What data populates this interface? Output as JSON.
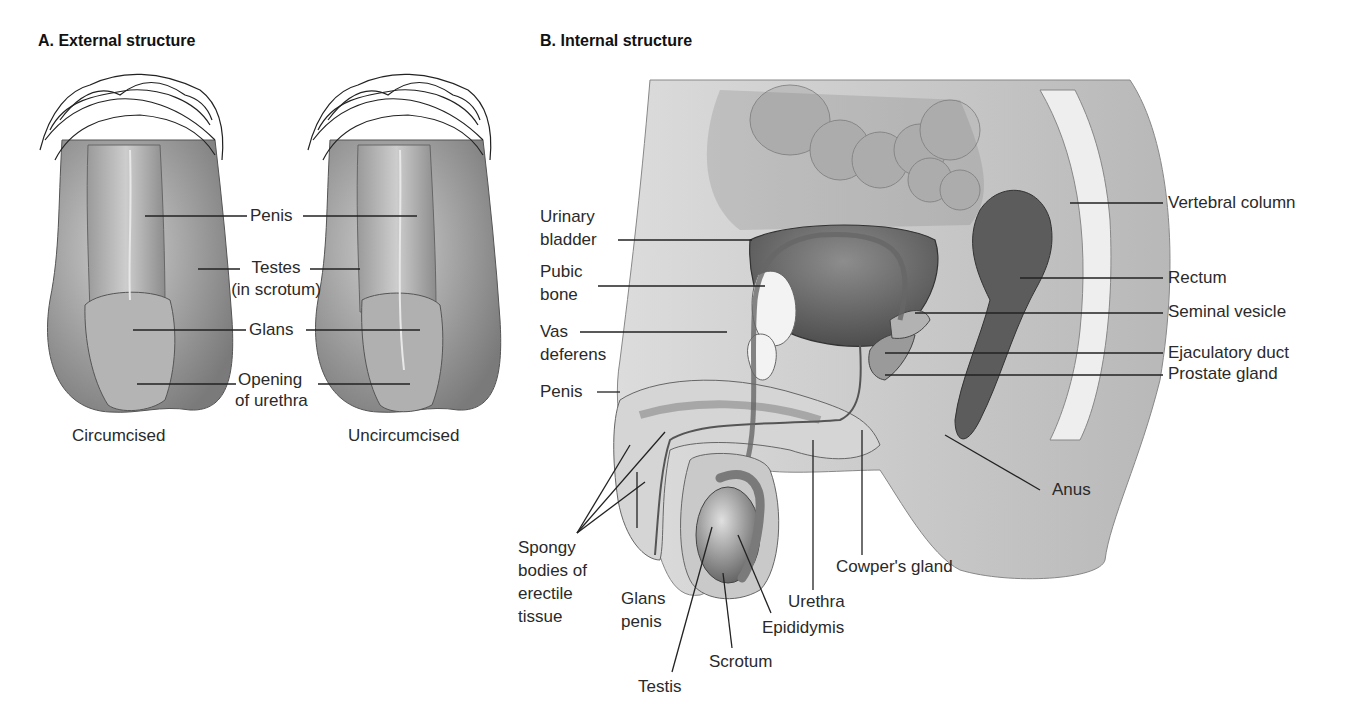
{
  "panels": {
    "external": {
      "title": "A. External structure",
      "captions": [
        "Circumcised",
        "Uncircumcised"
      ],
      "labels": {
        "penis": "Penis",
        "testes_1": "Testes",
        "testes_2": "(in scrotum)",
        "glans": "Glans",
        "opening_1": "Opening",
        "opening_2": "of urethra"
      }
    },
    "internal": {
      "title": "B. Internal structure",
      "labels": {
        "urinary_bladder_1": "Urinary",
        "urinary_bladder_2": "bladder",
        "pubic_bone_1": "Pubic",
        "pubic_bone_2": "bone",
        "vas_deferens_1": "Vas",
        "vas_deferens_2": "deferens",
        "penis": "Penis",
        "spongy_1": "Spongy",
        "spongy_2": "bodies of",
        "spongy_3": "erectile",
        "spongy_4": "tissue",
        "glans_penis_1": "Glans",
        "glans_penis_2": "penis",
        "testis": "Testis",
        "scrotum": "Scrotum",
        "epididymis": "Epididymis",
        "urethra": "Urethra",
        "cowpers_gland": "Cowper's gland",
        "anus": "Anus",
        "vertebral_column": "Vertebral column",
        "rectum": "Rectum",
        "seminal_vesicle": "Seminal vesicle",
        "ejaculatory_duct": "Ejaculatory duct",
        "prostate_gland": "Prostate gland"
      }
    }
  },
  "colors": {
    "label_text": "#2a2a2a",
    "leader_line": "#222222",
    "tissue_light": "#d9d9d9",
    "tissue_mid": "#a9a9a9",
    "tissue_dark": "#6e6e6e"
  }
}
